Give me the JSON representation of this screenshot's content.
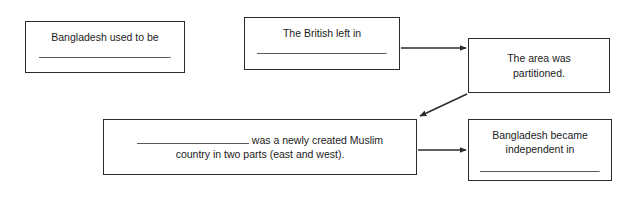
{
  "diagram": {
    "type": "flowchart",
    "line_color": "#2b2b2b",
    "blank_color": "#5a5a5a",
    "background": "#ffffff",
    "boxes": [
      {
        "id": "used-to-be",
        "text": "Bangladesh used to be",
        "has_blank": true,
        "blank_suffix": "."
      },
      {
        "id": "british-left",
        "text": "The British left in",
        "has_blank": true,
        "blank_suffix": "."
      },
      {
        "id": "partitioned",
        "text": "The area was\npartitioned.",
        "has_blank": false,
        "blank_suffix": ""
      },
      {
        "id": "muslim-country",
        "text_before_blank": "",
        "text_after_blank": " was a newly created Muslim\ncountry in two parts (east and west).",
        "has_blank": true,
        "blank_suffix": ""
      },
      {
        "id": "became-independent",
        "text": "Bangladesh became\nindependent in",
        "has_blank": true,
        "blank_suffix": "."
      }
    ],
    "connectors": [
      {
        "id": "british-to-partitioned",
        "from": "british-left",
        "to": "partitioned",
        "style": "horizontal-arrow"
      },
      {
        "id": "partitioned-to-muslim-country",
        "from": "partitioned",
        "to": "muslim-country",
        "style": "diagonal-arrow"
      },
      {
        "id": "muslim-country-to-independent",
        "from": "muslim-country",
        "to": "became-independent",
        "style": "horizontal-arrow"
      }
    ]
  }
}
